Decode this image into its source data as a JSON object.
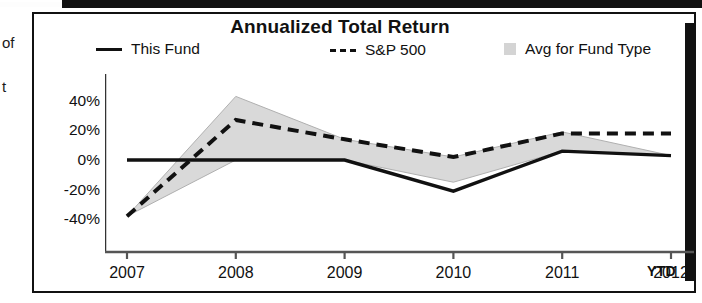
{
  "figure": {
    "title": "Annualized Total Return",
    "ytd_note": "YTD"
  },
  "margin_fragments": [
    {
      "text": "of",
      "top": 34
    },
    {
      "text": "t",
      "top": 78
    }
  ],
  "legend": [
    {
      "label": "This Fund",
      "swatch": "solid-line-swatch"
    },
    {
      "label": "S&P 500",
      "swatch": "dashed-line-swatch"
    },
    {
      "label": "Avg for Fund Type",
      "swatch": "filled-area-swatch"
    }
  ],
  "chart_data": {
    "type": "line",
    "title": "Annualized Total Return",
    "xlabel": "",
    "ylabel": "",
    "categories": [
      "2007",
      "2008",
      "2009",
      "2010",
      "2011",
      "2012"
    ],
    "x_axis_note": "YTD",
    "ylim": [
      -50,
      50
    ],
    "yticks": [
      40,
      20,
      0,
      -20,
      -40
    ],
    "ytick_labels": [
      "40%",
      "20%",
      "0%",
      "-20%",
      "-40%"
    ],
    "grid": false,
    "legend_position": "top",
    "series": [
      {
        "name": "This Fund",
        "style": "solid",
        "color": "#111111",
        "values": [
          0,
          0,
          0,
          -21,
          6,
          3
        ]
      },
      {
        "name": "S&P 500",
        "style": "dashed",
        "color": "#111111",
        "values": [
          -38,
          27,
          14,
          2,
          18,
          18
        ]
      },
      {
        "name": "Avg for Fund Type",
        "style": "band",
        "color": "#d4d4d4",
        "upper": [
          -38,
          43,
          14,
          2,
          19,
          3
        ],
        "lower": [
          -38,
          0,
          0,
          -15,
          6,
          3
        ]
      }
    ]
  }
}
